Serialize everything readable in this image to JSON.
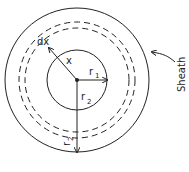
{
  "diagram": {
    "labels": {
      "dx": "dx",
      "x": "x",
      "r1": "r",
      "r1_sub": "1",
      "r2": "r",
      "r2_sub": "2",
      "r2_outer": "r",
      "r2_outer_sub": "2",
      "sheath": "Sheath"
    },
    "colors": {
      "stroke": "#222222",
      "background": "#ffffff"
    }
  }
}
